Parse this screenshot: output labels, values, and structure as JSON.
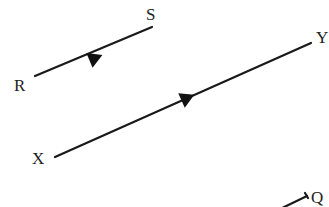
{
  "diagram": {
    "type": "line-segments-with-direction-arrows",
    "segments": [
      {
        "id": "RS",
        "start_label": "R",
        "end_label": "S",
        "x1": 35,
        "y1": 76,
        "x2": 152,
        "y2": 27,
        "arrow_at": [
          95,
          58
        ],
        "start_label_pos": [
          14,
          90
        ],
        "end_label_pos": [
          148,
          20
        ]
      },
      {
        "id": "XY",
        "start_label": "X",
        "end_label": "Y",
        "x1": 55,
        "y1": 157,
        "x2": 311,
        "y2": 43,
        "arrow_at": [
          187,
          98
        ],
        "start_label_pos": [
          33,
          163
        ],
        "end_label_pos": [
          316,
          42
        ]
      },
      {
        "id": "PQ",
        "start_label": "",
        "end_label": "Q",
        "x1": 278,
        "y1": 210,
        "x2": 307,
        "y2": 196,
        "arrow_at": null,
        "start_label_pos": null,
        "end_label_pos": [
          312,
          203
        ]
      }
    ],
    "colors": {
      "line": "#1a1a1a",
      "text": "#222222",
      "background": "#ffffff"
    }
  }
}
